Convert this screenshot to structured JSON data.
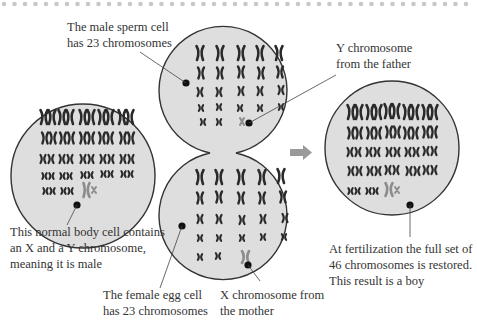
{
  "colors": {
    "cell_fill": "#dedede",
    "cell_stroke": "#333333",
    "chromosome": "#2a2a2a",
    "sex_chromosome": "#8c8c8c",
    "arrow": "#9a9a9a",
    "dots": "#c8c8c8",
    "text": "#333333"
  },
  "labels": {
    "sperm_cell": [
      "The male sperm cell",
      "has 23 chromosomes"
    ],
    "y_chromosome": [
      "Y chromosome",
      "from the father"
    ],
    "body_cell": [
      "This normal body cell contains",
      "an X and a Y chromosome,",
      "meaning it is male"
    ],
    "egg_cell": [
      "The female egg cell",
      "has 23 chromosomes"
    ],
    "x_chromosome": [
      "X chromosome from",
      "the mother"
    ],
    "fertilization": [
      "At fertilization the full set of",
      "46 chromosomes is restored.",
      "This result is a boy"
    ]
  },
  "cells": {
    "body_cell": {
      "type": "diploid",
      "chromosome_count": 46,
      "sex_chromosomes": "XY"
    },
    "sperm_cell": {
      "type": "haploid",
      "chromosome_count": 23,
      "sex_chromosome": "Y"
    },
    "egg_cell": {
      "type": "haploid",
      "chromosome_count": 23,
      "sex_chromosome": "X"
    },
    "zygote": {
      "type": "diploid",
      "chromosome_count": 46,
      "sex_chromosomes": "XY",
      "result": "boy"
    }
  }
}
